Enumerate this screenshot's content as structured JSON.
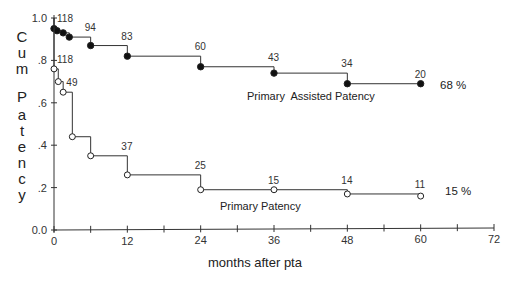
{
  "chart_data": {
    "type": "line",
    "subtype": "kaplan-meier step",
    "title": "",
    "xlabel": "months after pta",
    "ylabel": "Cum Patency",
    "xlim": [
      0,
      72
    ],
    "ylim": [
      0,
      1.0
    ],
    "x_ticks": [
      0,
      12,
      24,
      36,
      48,
      60,
      72
    ],
    "x_minor_ticks": [
      6,
      18,
      30,
      42,
      54,
      66
    ],
    "y_ticks": [
      0.0,
      0.2,
      0.4,
      0.6,
      0.8,
      1.0
    ],
    "y_tick_labels": [
      "0.0",
      ".2",
      ".4",
      ".6",
      ".8",
      "1.0"
    ],
    "grid": false,
    "series": [
      {
        "name": "Primary Assisted Patency",
        "marker": "filled-circle",
        "final_label": "68 %",
        "points": [
          {
            "x": 0,
            "y": 0.95
          },
          {
            "x": 0.5,
            "y": 0.94
          },
          {
            "x": 1.5,
            "y": 0.93
          },
          {
            "x": 2.5,
            "y": 0.91
          },
          {
            "x": 6,
            "y": 0.87
          },
          {
            "x": 12,
            "y": 0.82
          },
          {
            "x": 24,
            "y": 0.77
          },
          {
            "x": 36,
            "y": 0.74
          },
          {
            "x": 48,
            "y": 0.69
          },
          {
            "x": 60,
            "y": 0.69
          }
        ],
        "at_risk": [
          {
            "x": 0,
            "n": "118"
          },
          {
            "x": 6,
            "n": "94"
          },
          {
            "x": 12,
            "n": "83"
          },
          {
            "x": 24,
            "n": "60"
          },
          {
            "x": 36,
            "n": "43"
          },
          {
            "x": 48,
            "n": "34"
          },
          {
            "x": 60,
            "n": "20"
          }
        ]
      },
      {
        "name": "Primary Patency",
        "marker": "open-circle",
        "final_label": "15 %",
        "points": [
          {
            "x": 0,
            "y": 0.76
          },
          {
            "x": 0.7,
            "y": 0.7
          },
          {
            "x": 1.5,
            "y": 0.65
          },
          {
            "x": 3,
            "y": 0.44
          },
          {
            "x": 6,
            "y": 0.35
          },
          {
            "x": 12,
            "y": 0.26
          },
          {
            "x": 24,
            "y": 0.19
          },
          {
            "x": 36,
            "y": 0.19
          },
          {
            "x": 48,
            "y": 0.17
          },
          {
            "x": 60,
            "y": 0.16
          }
        ],
        "at_risk": [
          {
            "x": 0,
            "n": "118"
          },
          {
            "x": 3,
            "n": "49"
          },
          {
            "x": 12,
            "n": "37"
          },
          {
            "x": 24,
            "n": "25"
          },
          {
            "x": 36,
            "n": "15"
          },
          {
            "x": 48,
            "n": "14"
          },
          {
            "x": 60,
            "n": "11"
          }
        ]
      }
    ]
  },
  "labels": {
    "xlabel": "months after pta",
    "ylabel_chars": [
      "C",
      "u",
      "m",
      "P",
      "a",
      "t",
      "e",
      "n",
      "c",
      "y"
    ],
    "assisted_series": "Primary  Assisted Patency",
    "primary_series": "Primary Patency",
    "assisted_pct": "68 %",
    "primary_pct": "15 %"
  }
}
